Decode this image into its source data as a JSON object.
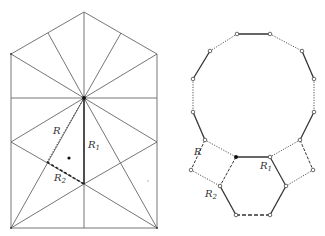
{
  "figure": {
    "left_panel": {
      "name": "pentagon-house dissection",
      "labels": {
        "R": "R",
        "R1": "R",
        "R1_sub": "1",
        "R2": "R",
        "R2_sub": "2"
      }
    },
    "right_panel": {
      "name": "dodecagon with squares and hexagon",
      "labels": {
        "R": "R",
        "R1": "R",
        "R1_sub": "1",
        "R2": "R",
        "R2_sub": "2"
      }
    },
    "colors": {
      "line": "#555555",
      "thick_line": "#222222",
      "background": "#ffffff"
    }
  }
}
